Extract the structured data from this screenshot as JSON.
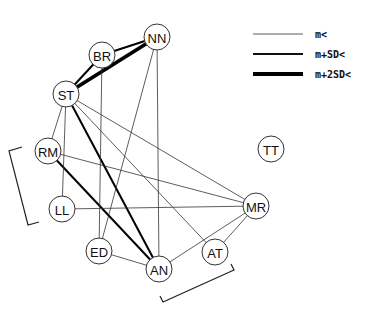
{
  "diagram": {
    "type": "network",
    "legend": [
      {
        "label": "m<",
        "weight": "thin",
        "stroke_width": 0.8
      },
      {
        "label": "m+SD<",
        "weight": "medium",
        "stroke_width": 2
      },
      {
        "label": "m+2SD<",
        "weight": "thick",
        "stroke_width": 3.8
      }
    ],
    "nodes": [
      {
        "id": "NN",
        "label": "NN",
        "x": 157,
        "y": 37
      },
      {
        "id": "BR",
        "label": "BR",
        "x": 102,
        "y": 55
      },
      {
        "id": "ST",
        "label": "ST",
        "x": 66,
        "y": 94
      },
      {
        "id": "RM",
        "label": "RM",
        "x": 48,
        "y": 151
      },
      {
        "id": "LL",
        "label": "LL",
        "x": 62,
        "y": 209
      },
      {
        "id": "ED",
        "label": "ED",
        "x": 99,
        "y": 251
      },
      {
        "id": "AN",
        "label": "AN",
        "x": 159,
        "y": 269
      },
      {
        "id": "AT",
        "label": "AT",
        "x": 215,
        "y": 252
      },
      {
        "id": "MR",
        "label": "MR",
        "x": 256,
        "y": 206
      },
      {
        "id": "TT",
        "label": "TT",
        "x": 271,
        "y": 149
      }
    ],
    "edges": [
      {
        "from": "ST",
        "to": "NN",
        "weight": "thick"
      },
      {
        "from": "BR",
        "to": "NN",
        "weight": "medium"
      },
      {
        "from": "BR",
        "to": "ST",
        "weight": "medium"
      },
      {
        "from": "ST",
        "to": "AN",
        "weight": "medium"
      },
      {
        "from": "RM",
        "to": "AN",
        "weight": "medium"
      },
      {
        "from": "NN",
        "to": "AN",
        "weight": "thin"
      },
      {
        "from": "NN",
        "to": "ED",
        "weight": "thin"
      },
      {
        "from": "BR",
        "to": "ED",
        "weight": "thin"
      },
      {
        "from": "ST",
        "to": "RM",
        "weight": "thin"
      },
      {
        "from": "ST",
        "to": "LL",
        "weight": "thin"
      },
      {
        "from": "ST",
        "to": "MR",
        "weight": "thin"
      },
      {
        "from": "ST",
        "to": "AT",
        "weight": "thin"
      },
      {
        "from": "RM",
        "to": "MR",
        "weight": "thin"
      },
      {
        "from": "LL",
        "to": "MR",
        "weight": "thin"
      },
      {
        "from": "ED",
        "to": "AN",
        "weight": "thin"
      },
      {
        "from": "AN",
        "to": "MR",
        "weight": "thin"
      },
      {
        "from": "AT",
        "to": "MR",
        "weight": "thin"
      }
    ],
    "brackets": [
      {
        "name": "left-bracket-rm-ll",
        "points": "22,147 9,151 28,225 39,222"
      },
      {
        "name": "bottom-bracket-an-at",
        "points": "160,296 163,302 234,270 231,264"
      }
    ]
  }
}
